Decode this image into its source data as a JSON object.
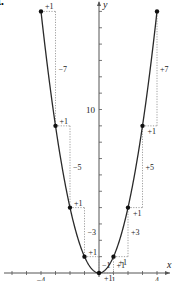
{
  "part_label": "a.",
  "axes": {
    "x_label": "x",
    "y_label": "y",
    "x_tick_labels": [
      {
        "value": -4,
        "text": "−4"
      },
      {
        "value": 1,
        "text": "1"
      },
      {
        "value": 4,
        "text": "4"
      }
    ],
    "y_tick_labels": [
      {
        "value": 10,
        "text": "10"
      }
    ]
  },
  "function": "y = x^2",
  "points": [
    {
      "x": -4,
      "y": 16
    },
    {
      "x": -3,
      "y": 9
    },
    {
      "x": -2,
      "y": 4
    },
    {
      "x": -1,
      "y": 1
    },
    {
      "x": 0,
      "y": 0
    },
    {
      "x": 1,
      "y": 1
    },
    {
      "x": 2,
      "y": 4
    },
    {
      "x": 3,
      "y": 9
    },
    {
      "x": 4,
      "y": 16
    }
  ],
  "left_steps": [
    {
      "from_x": -4,
      "run": "+1",
      "rise": "−7"
    },
    {
      "from_x": -3,
      "run": "+1",
      "rise": "−5"
    },
    {
      "from_x": -2,
      "run": "+1",
      "rise": "−3"
    },
    {
      "from_x": -1,
      "run": "+1",
      "rise": "−1"
    }
  ],
  "right_steps": [
    {
      "from_x": 0,
      "run": "+1",
      "rise": "+1"
    },
    {
      "from_x": 1,
      "run": "+1",
      "rise": "+3"
    },
    {
      "from_x": 2,
      "run": "+1",
      "rise": "+5"
    },
    {
      "from_x": 3,
      "run": "+1",
      "rise": "+7"
    }
  ],
  "colors": {
    "curve": "#2a2a2a",
    "axis": "#555555",
    "dotted": "#888888",
    "point": "#111111",
    "text": "#222222"
  }
}
